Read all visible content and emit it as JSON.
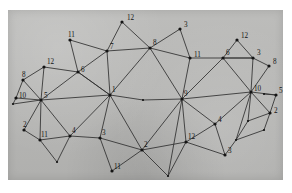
{
  "figure": {
    "background_color": "#ffffff",
    "panel_color": "#b9b9b7",
    "edge_color": "#2f2f2f",
    "node_color": "#141414",
    "label_color": "#141414",
    "panel": {
      "x": 8,
      "y": 10,
      "width": 275,
      "height": 170
    }
  },
  "chart_data": {
    "type": "diagram",
    "subtype": "node-link-graph",
    "xlabel": "",
    "ylabel": "",
    "grid": false,
    "legend": "none",
    "node_count": 37,
    "edge_count": 74,
    "nodes": [
      {
        "id": "n1",
        "label": "12",
        "x": 122,
        "y": 22,
        "label_dx": 5,
        "label_dy": -2
      },
      {
        "id": "n2",
        "label": "3",
        "x": 180,
        "y": 29,
        "label_dx": 4,
        "label_dy": -2
      },
      {
        "id": "n3",
        "label": "11",
        "x": 70,
        "y": 40,
        "label_dx": -2,
        "label_dy": -3
      },
      {
        "id": "n4",
        "label": "12",
        "x": 237,
        "y": 40,
        "label_dx": 4,
        "label_dy": -2
      },
      {
        "id": "n5",
        "label": "7",
        "x": 107,
        "y": 51,
        "label_dx": 3,
        "label_dy": -2
      },
      {
        "id": "n6",
        "label": "8",
        "x": 150,
        "y": 48,
        "label_dx": 3,
        "label_dy": -3
      },
      {
        "id": "n7",
        "label": "11",
        "x": 190,
        "y": 58,
        "label_dx": 4,
        "label_dy": -1
      },
      {
        "id": "n8",
        "label": "6",
        "x": 223,
        "y": 58,
        "label_dx": 3,
        "label_dy": -3
      },
      {
        "id": "n9",
        "label": "3",
        "x": 253,
        "y": 58,
        "label_dx": 4,
        "label_dy": -3
      },
      {
        "id": "n10",
        "label": "12",
        "x": 44,
        "y": 67,
        "label_dx": 3,
        "label_dy": -3
      },
      {
        "id": "n11",
        "label": "6",
        "x": 78,
        "y": 72,
        "label_dx": 3,
        "label_dy": 0
      },
      {
        "id": "n12",
        "label": "8",
        "x": 269,
        "y": 66,
        "label_dx": 4,
        "label_dy": -2
      },
      {
        "id": "n13",
        "label": "8",
        "x": 23,
        "y": 80,
        "label_dx": -1,
        "label_dy": -3
      },
      {
        "id": "n14",
        "label": "10",
        "x": 16,
        "y": 98,
        "label_dx": 3,
        "label_dy": 0
      },
      {
        "id": "n15",
        "label": "10",
        "x": 251,
        "y": 92,
        "label_dx": 3,
        "label_dy": -1
      },
      {
        "id": "n16",
        "label": "5",
        "x": 276,
        "y": 95,
        "label_dx": 3,
        "label_dy": -2
      },
      {
        "id": "n17",
        "label": "5",
        "x": 41,
        "y": 100,
        "label_dx": 3,
        "label_dy": -2
      },
      {
        "id": "n18",
        "label": "1",
        "x": 110,
        "y": 95,
        "label_dx": 2,
        "label_dy": -3
      },
      {
        "id": "n19",
        "label": "9",
        "x": 182,
        "y": 99,
        "label_dx": 2,
        "label_dy": -3
      },
      {
        "id": "n20",
        "label": "",
        "x": 143,
        "y": 100,
        "label_dx": 0,
        "label_dy": 0
      },
      {
        "id": "n21",
        "label": "2",
        "x": 270,
        "y": 113,
        "label_dx": 4,
        "label_dy": 0
      },
      {
        "id": "n22",
        "label": "2",
        "x": 24,
        "y": 130,
        "label_dx": -1,
        "label_dy": -3
      },
      {
        "id": "n23",
        "label": "4",
        "x": 215,
        "y": 124,
        "label_dx": 3,
        "label_dy": -2
      },
      {
        "id": "n24",
        "label": "11",
        "x": 40,
        "y": 140,
        "label_dx": 1,
        "label_dy": -3
      },
      {
        "id": "n25",
        "label": "4",
        "x": 70,
        "y": 136,
        "label_dx": 2,
        "label_dy": -3
      },
      {
        "id": "n26",
        "label": "3",
        "x": 100,
        "y": 138,
        "label_dx": 2,
        "label_dy": -3
      },
      {
        "id": "n27",
        "label": "12",
        "x": 186,
        "y": 142,
        "label_dx": 2,
        "label_dy": -3
      },
      {
        "id": "n28",
        "label": "2",
        "x": 142,
        "y": 150,
        "label_dx": 2,
        "label_dy": -3
      },
      {
        "id": "n29",
        "label": "3",
        "x": 225,
        "y": 155,
        "label_dx": 3,
        "label_dy": -2
      },
      {
        "id": "n30",
        "label": "",
        "x": 57,
        "y": 162,
        "label_dx": 0,
        "label_dy": 0
      },
      {
        "id": "n31",
        "label": "11",
        "x": 112,
        "y": 171,
        "label_dx": 2,
        "label_dy": -2
      },
      {
        "id": "n32",
        "label": "",
        "x": 168,
        "y": 176,
        "label_dx": 0,
        "label_dy": 0
      },
      {
        "id": "n33",
        "label": "",
        "x": 248,
        "y": 121,
        "label_dx": 0,
        "label_dy": 0
      },
      {
        "id": "n34",
        "label": "",
        "x": 236,
        "y": 140,
        "label_dx": 0,
        "label_dy": 0
      },
      {
        "id": "n35",
        "label": "",
        "x": 13,
        "y": 104,
        "label_dx": 0,
        "label_dy": 0
      },
      {
        "id": "n36",
        "label": "",
        "x": 264,
        "y": 94,
        "label_dx": 0,
        "label_dy": 0
      },
      {
        "id": "n37",
        "label": "",
        "x": 264,
        "y": 130,
        "label_dx": 0,
        "label_dy": 0
      }
    ],
    "edges": [
      [
        "n1",
        "n5"
      ],
      [
        "n1",
        "n6"
      ],
      [
        "n5",
        "n6"
      ],
      [
        "n3",
        "n5"
      ],
      [
        "n3",
        "n11"
      ],
      [
        "n5",
        "n11"
      ],
      [
        "n2",
        "n6"
      ],
      [
        "n2",
        "n7"
      ],
      [
        "n6",
        "n7"
      ],
      [
        "n6",
        "n18"
      ],
      [
        "n5",
        "n18"
      ],
      [
        "n11",
        "n18"
      ],
      [
        "n6",
        "n19"
      ],
      [
        "n7",
        "n19"
      ],
      [
        "n7",
        "n8"
      ],
      [
        "n8",
        "n4"
      ],
      [
        "n4",
        "n9"
      ],
      [
        "n8",
        "n9"
      ],
      [
        "n9",
        "n12"
      ],
      [
        "n12",
        "n15"
      ],
      [
        "n9",
        "n15"
      ],
      [
        "n8",
        "n15"
      ],
      [
        "n8",
        "n19"
      ],
      [
        "n19",
        "n15"
      ],
      [
        "n15",
        "n16"
      ],
      [
        "n16",
        "n21"
      ],
      [
        "n15",
        "n21"
      ],
      [
        "n10",
        "n11"
      ],
      [
        "n10",
        "n13"
      ],
      [
        "n10",
        "n17"
      ],
      [
        "n13",
        "n14"
      ],
      [
        "n13",
        "n17"
      ],
      [
        "n14",
        "n17"
      ],
      [
        "n11",
        "n17"
      ],
      [
        "n11",
        "n18"
      ],
      [
        "n17",
        "n18"
      ],
      [
        "n17",
        "n22"
      ],
      [
        "n22",
        "n24"
      ],
      [
        "n17",
        "n24"
      ],
      [
        "n24",
        "n25"
      ],
      [
        "n17",
        "n25"
      ],
      [
        "n24",
        "n30"
      ],
      [
        "n25",
        "n30"
      ],
      [
        "n25",
        "n26"
      ],
      [
        "n26",
        "n18"
      ],
      [
        "n18",
        "n28"
      ],
      [
        "n26",
        "n28"
      ],
      [
        "n26",
        "n31"
      ],
      [
        "n28",
        "n31"
      ],
      [
        "n28",
        "n19"
      ],
      [
        "n28",
        "n27"
      ],
      [
        "n27",
        "n19"
      ],
      [
        "n27",
        "n32"
      ],
      [
        "n28",
        "n32"
      ],
      [
        "n27",
        "n23"
      ],
      [
        "n23",
        "n19"
      ],
      [
        "n23",
        "n29"
      ],
      [
        "n27",
        "n29"
      ],
      [
        "n23",
        "n15"
      ],
      [
        "n15",
        "n33"
      ],
      [
        "n33",
        "n21"
      ],
      [
        "n33",
        "n34"
      ],
      [
        "n21",
        "n37"
      ],
      [
        "n34",
        "n37"
      ],
      [
        "n15",
        "n34"
      ],
      [
        "n18",
        "n20"
      ],
      [
        "n20",
        "n19"
      ],
      [
        "n14",
        "n35"
      ],
      [
        "n35",
        "n17"
      ],
      [
        "n16",
        "n36"
      ],
      [
        "n9",
        "n8"
      ],
      [
        "n29",
        "n34"
      ],
      [
        "n18",
        "n25"
      ],
      [
        "n19",
        "n32"
      ]
    ]
  }
}
